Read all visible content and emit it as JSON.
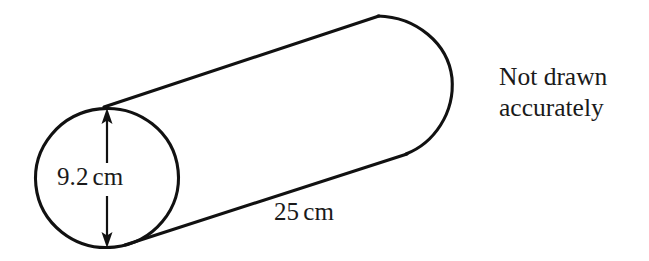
{
  "figure": {
    "name": "cylinder-diagram",
    "background_color": "#ffffff",
    "stroke_color": "#111111",
    "text_color": "#1a1a1a"
  },
  "labels": {
    "diameter": {
      "value": "9.2",
      "unit": "cm",
      "full_text": "9.2 cm"
    },
    "length": {
      "value": "25",
      "unit": "cm",
      "full_text": "25 cm"
    }
  },
  "note": {
    "line1": "Not drawn",
    "line2": "accurately",
    "full_text": "Not drawn accurately"
  },
  "geometry": {
    "left_end_ellipse": {
      "cx": 107,
      "cy": 178,
      "rx": 72,
      "ry": 70
    },
    "right_end_arc": {
      "top_x": 378,
      "top_y": 16,
      "right_x": 452,
      "right_y": 76,
      "bottom_x": 406,
      "bottom_y": 154
    },
    "top_edge": {
      "x1": 105,
      "y1": 107,
      "x2": 378,
      "y2": 16
    },
    "bottom_edge": {
      "x1": 126,
      "y1": 245,
      "x2": 406,
      "y2": 154
    },
    "dimension_arrow": {
      "x": 107,
      "y_top": 109,
      "y_bottom": 247
    }
  }
}
